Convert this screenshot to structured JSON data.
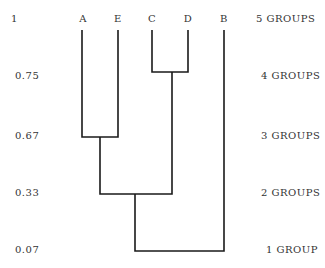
{
  "levels": [
    {
      "value": "1",
      "groups": "5 GROUPS"
    },
    {
      "value": "0.75",
      "groups": "4 GROUPS"
    },
    {
      "value": "0.67",
      "groups": "3 GROUPS"
    },
    {
      "value": "0.33",
      "groups": "2 GROUPS"
    },
    {
      "value": "0.07",
      "groups": "1 GROUP"
    }
  ],
  "leaves": [
    "A",
    "E",
    "C",
    "D",
    "B"
  ],
  "merges": [
    {
      "left": "C",
      "right": "D",
      "level": "0.75"
    },
    {
      "left": "A",
      "right": "E",
      "level": "0.67"
    },
    {
      "left": "AE",
      "right": "CD",
      "level": "0.33"
    },
    {
      "left": "AECD",
      "right": "B",
      "level": "0.07"
    }
  ]
}
